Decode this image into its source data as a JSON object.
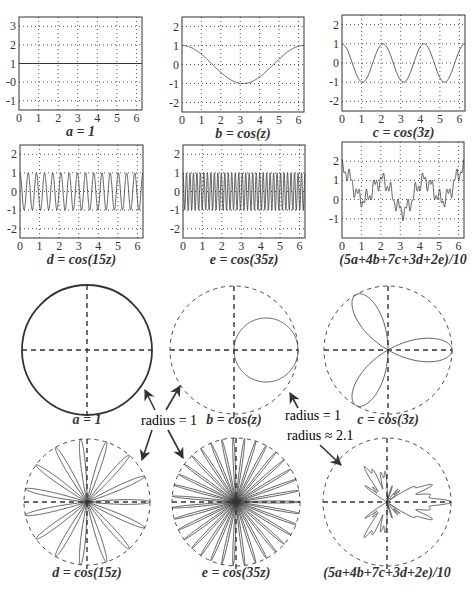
{
  "chart_data": [
    {
      "type": "line",
      "id": "a",
      "title": "a = 1",
      "function": "1",
      "x_range": [
        0,
        6.2832
      ],
      "ylim": [
        -1.5,
        3.5
      ],
      "xticks": [
        0,
        1,
        2,
        3,
        4,
        5,
        6
      ],
      "yticks": [
        3,
        2,
        1,
        0,
        -1
      ],
      "ytick_labels": [
        "3",
        "2",
        "1",
        "-0",
        "-1"
      ],
      "grid": true,
      "values_sample": {
        "x": [
          0,
          1,
          2,
          3,
          4,
          5,
          6
        ],
        "y": [
          1,
          1,
          1,
          1,
          1,
          1,
          1
        ]
      }
    },
    {
      "type": "line",
      "id": "b",
      "title": "b = cos(z)",
      "function": "cos(z)",
      "x_range": [
        0,
        6.2832
      ],
      "ylim": [
        -2.5,
        2.5
      ],
      "xticks": [
        0,
        1,
        2,
        3,
        4,
        5,
        6
      ],
      "yticks": [
        2,
        1,
        0,
        -1,
        -2
      ],
      "ytick_labels": [
        "2",
        "1",
        "0",
        "-1",
        "-2"
      ],
      "grid": true,
      "values_sample": {
        "x": [
          0,
          1,
          2,
          3,
          4,
          5,
          6
        ],
        "y": [
          1,
          0.54,
          -0.42,
          -0.99,
          -0.65,
          0.28,
          0.96
        ]
      }
    },
    {
      "type": "line",
      "id": "c",
      "title": "c = cos(3z)",
      "function": "cos(3z)",
      "x_range": [
        0,
        6.2832
      ],
      "ylim": [
        -2.5,
        2.5
      ],
      "xticks": [
        0,
        1,
        2,
        3,
        4,
        5,
        6
      ],
      "yticks": [
        2,
        1,
        0,
        -1,
        -2
      ],
      "ytick_labels": [
        "2",
        "1",
        "0",
        "-1",
        "-2"
      ],
      "grid": true
    },
    {
      "type": "line",
      "id": "d",
      "title": "d = cos(15z)",
      "function": "cos(15z)",
      "x_range": [
        0,
        6.2832
      ],
      "ylim": [
        -2.5,
        2.5
      ],
      "xticks": [
        0,
        1,
        2,
        3,
        4,
        5,
        6
      ],
      "yticks": [
        2,
        1,
        0,
        -1,
        -2
      ],
      "ytick_labels": [
        "2",
        "1",
        "0",
        "-1",
        "-2"
      ],
      "grid": true
    },
    {
      "type": "line",
      "id": "e",
      "title": "e = cos(35z)",
      "function": "cos(35z)",
      "x_range": [
        0,
        6.2832
      ],
      "ylim": [
        -2.5,
        2.5
      ],
      "xticks": [
        0,
        1,
        2,
        3,
        4,
        5,
        6
      ],
      "yticks": [
        2,
        1,
        0,
        -1,
        -2
      ],
      "ytick_labels": [
        "2",
        "1",
        "0",
        "-1",
        "-2"
      ],
      "grid": true
    },
    {
      "type": "line",
      "id": "mix",
      "title": "(5a+4b+7c+3d+2e)/10",
      "function": "(5 + 4cos(z) + 7cos(3z) + 3cos(15z) + 2cos(35z))/10",
      "x_range": [
        0,
        6.2832
      ],
      "ylim": [
        -2,
        3
      ],
      "xticks": [
        0,
        1,
        2,
        3,
        4,
        5,
        6
      ],
      "yticks": [
        2,
        1,
        0,
        -1
      ],
      "ytick_labels": [
        "2",
        "1",
        "0",
        "-1"
      ],
      "grid": true
    },
    {
      "type": "polar",
      "id": "polar-a",
      "title": "a = 1",
      "function": "1",
      "reference_circle_radius": 1,
      "reference_circle_style": "solid"
    },
    {
      "type": "polar",
      "id": "polar-b",
      "title": "b = cos(z)",
      "function": "cos(z)",
      "reference_circle_radius": 1
    },
    {
      "type": "polar",
      "id": "polar-c",
      "title": "c = cos(3z)",
      "function": "cos(3z)",
      "reference_circle_radius": 1
    },
    {
      "type": "polar",
      "id": "polar-d",
      "title": "d = cos(15z)",
      "function": "cos(15z)",
      "reference_circle_radius": 1
    },
    {
      "type": "polar",
      "id": "polar-e",
      "title": "e = cos(35z)",
      "function": "cos(35z)",
      "reference_circle_radius": 1
    },
    {
      "type": "polar",
      "id": "polar-mix",
      "title": "(5a+4b+7c+3d+2e)/10",
      "function": "(5 + 4cos(z) + 7cos(3z) + 3cos(15z) + 2cos(35z))/10",
      "reference_circle_radius": 2.1
    }
  ],
  "annotations": {
    "radius_one_left": "radius = 1",
    "radius_one_right": "radius = 1",
    "radius_mix": "radius ≈ 2.1"
  },
  "colors": {
    "ink": "#333333",
    "grid": "#555555",
    "background": "#ffffff"
  }
}
